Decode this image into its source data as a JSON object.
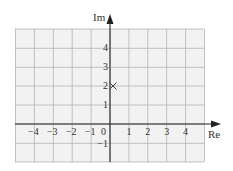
{
  "diagram": {
    "type": "argand-diagram",
    "axes": {
      "x_label": "Re",
      "y_label": "Im",
      "origin_label": "0",
      "x_ticks": [
        {
          "value": -4,
          "label": "−4"
        },
        {
          "value": -3,
          "label": "−3"
        },
        {
          "value": -2,
          "label": "−2"
        },
        {
          "value": -1,
          "label": "−1"
        },
        {
          "value": 1,
          "label": "1"
        },
        {
          "value": 2,
          "label": "2"
        },
        {
          "value": 3,
          "label": "3"
        },
        {
          "value": 4,
          "label": "4"
        }
      ],
      "y_ticks": [
        {
          "value": 4,
          "label": "4"
        },
        {
          "value": 3,
          "label": "3"
        },
        {
          "value": 2,
          "label": "2"
        },
        {
          "value": 1,
          "label": "1"
        },
        {
          "value": -1,
          "label": "−1"
        }
      ],
      "x_range": [
        -5,
        5
      ],
      "y_range": [
        -2,
        5
      ]
    },
    "points": [
      {
        "re": 0,
        "im": 2,
        "marker": "cross",
        "label": ""
      }
    ],
    "colors": {
      "grid_fill": "#f2f2f2",
      "grid_line": "#b4b4b4",
      "axis": "#222222",
      "text": "#333333",
      "marker": "#444444"
    }
  }
}
